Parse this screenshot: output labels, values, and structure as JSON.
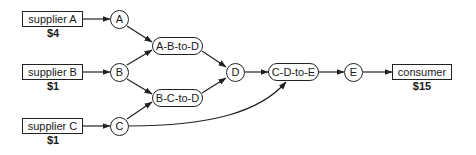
{
  "suppliers": [
    {
      "id": "supplier-a",
      "label": "supplier A",
      "price": "$4"
    },
    {
      "id": "supplier-b",
      "label": "supplier B",
      "price": "$1"
    },
    {
      "id": "supplier-c",
      "label": "supplier C",
      "price": "$1"
    }
  ],
  "goods": [
    {
      "id": "A",
      "label": "A"
    },
    {
      "id": "B",
      "label": "B"
    },
    {
      "id": "C",
      "label": "C"
    },
    {
      "id": "D",
      "label": "D"
    },
    {
      "id": "E",
      "label": "E"
    }
  ],
  "transformers": [
    {
      "id": "a-b-to-d",
      "label": "A-B-to-D"
    },
    {
      "id": "b-c-to-d",
      "label": "B-C-to-D"
    },
    {
      "id": "c-d-to-e",
      "label": "C-D-to-E"
    }
  ],
  "consumer": {
    "label": "consumer",
    "price": "$15"
  },
  "edges": [
    [
      "supplier A",
      "A"
    ],
    [
      "supplier B",
      "B"
    ],
    [
      "supplier C",
      "C"
    ],
    [
      "A",
      "A-B-to-D"
    ],
    [
      "B",
      "A-B-to-D"
    ],
    [
      "B",
      "B-C-to-D"
    ],
    [
      "C",
      "B-C-to-D"
    ],
    [
      "A-B-to-D",
      "D"
    ],
    [
      "B-C-to-D",
      "D"
    ],
    [
      "D",
      "C-D-to-E"
    ],
    [
      "C",
      "C-D-to-E"
    ],
    [
      "C-D-to-E",
      "E"
    ],
    [
      "E",
      "consumer"
    ]
  ]
}
